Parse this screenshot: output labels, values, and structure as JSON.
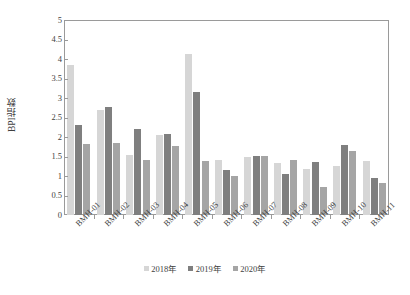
{
  "chart_data": {
    "type": "bar",
    "title": "",
    "xlabel": "",
    "ylabel": "BPI指数",
    "ylim": [
      0,
      5
    ],
    "ytick_step": 0.5,
    "yticks": [
      "0",
      "0.5",
      "1",
      "1.5",
      "2",
      "2.5",
      "3",
      "3.5",
      "4",
      "4.5",
      "5"
    ],
    "grid": false,
    "legend_position": "bottom-center",
    "categories": [
      "BMH-01",
      "BMH-02",
      "BMH-03",
      "BMH-04",
      "BMH-05",
      "BMH-06",
      "BMH-07",
      "BMH-08",
      "BMH-09",
      "BMH-10",
      "BMH-11"
    ],
    "series": [
      {
        "name": "2018年",
        "color": "#d6d6d6",
        "values": [
          3.85,
          2.68,
          1.55,
          2.05,
          4.13,
          1.4,
          1.48,
          1.33,
          1.18,
          1.25,
          1.38
        ]
      },
      {
        "name": "2019年",
        "color": "#7f7f7f",
        "values": [
          2.32,
          2.78,
          2.2,
          2.08,
          3.15,
          1.15,
          1.52,
          1.05,
          1.35,
          1.8,
          0.95
        ]
      },
      {
        "name": "2020年",
        "color": "#a5a5a5",
        "values": [
          1.83,
          1.85,
          1.42,
          1.78,
          1.38,
          1.0,
          1.52,
          1.4,
          0.72,
          1.65,
          0.83
        ]
      }
    ]
  },
  "axis": {
    "frame_color": "#9a9a9a",
    "text_color": "#3f3f3f"
  }
}
